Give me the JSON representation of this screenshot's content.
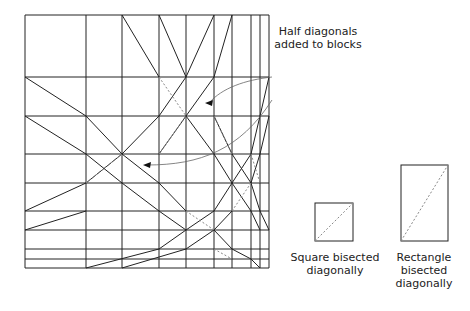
{
  "diagram": {
    "grid": {
      "x": [
        25,
        86,
        122,
        159,
        186,
        214,
        232,
        251,
        260,
        269
      ],
      "y": [
        15,
        77,
        116,
        154,
        183,
        211,
        230,
        249,
        259,
        268
      ],
      "stroke": "#222222"
    },
    "solid_diagonals": [
      [
        122,
        15,
        159,
        77
      ],
      [
        159,
        15,
        186,
        77
      ],
      [
        186,
        77,
        214,
        15
      ],
      [
        214,
        77,
        232,
        15
      ],
      [
        25,
        77,
        86,
        116
      ],
      [
        86,
        116,
        122,
        154
      ],
      [
        122,
        154,
        159,
        183
      ],
      [
        159,
        183,
        186,
        211
      ],
      [
        25,
        116,
        86,
        154
      ],
      [
        86,
        154,
        122,
        183
      ],
      [
        122,
        183,
        159,
        211
      ],
      [
        159,
        211,
        186,
        230
      ],
      [
        122,
        154,
        159,
        116
      ],
      [
        159,
        116,
        186,
        77
      ],
      [
        159,
        154,
        186,
        116
      ],
      [
        186,
        116,
        214,
        77
      ],
      [
        186,
        116,
        214,
        154
      ],
      [
        214,
        154,
        232,
        183
      ],
      [
        232,
        183,
        251,
        211
      ],
      [
        251,
        211,
        260,
        230
      ],
      [
        214,
        116,
        232,
        154
      ],
      [
        232,
        154,
        251,
        183
      ],
      [
        251,
        183,
        260,
        211
      ],
      [
        260,
        211,
        269,
        230
      ],
      [
        25,
        211,
        86,
        183
      ],
      [
        86,
        183,
        122,
        154
      ],
      [
        25,
        230,
        86,
        211
      ],
      [
        86,
        268,
        159,
        249
      ],
      [
        122,
        268,
        186,
        249
      ],
      [
        159,
        249,
        186,
        230
      ],
      [
        186,
        230,
        214,
        211
      ],
      [
        214,
        211,
        232,
        183
      ],
      [
        186,
        249,
        214,
        230
      ],
      [
        214,
        230,
        232,
        211
      ],
      [
        214,
        230,
        232,
        249
      ],
      [
        232,
        249,
        251,
        259
      ],
      [
        251,
        259,
        260,
        268
      ],
      [
        232,
        183,
        251,
        154
      ],
      [
        251,
        154,
        260,
        116
      ],
      [
        260,
        116,
        269,
        77
      ],
      [
        251,
        183,
        260,
        154
      ],
      [
        260,
        154,
        269,
        116
      ]
    ],
    "dashed_diagonals": [
      [
        159,
        77,
        186,
        116
      ],
      [
        214,
        116,
        232,
        154
      ],
      [
        86,
        183,
        122,
        154
      ],
      [
        159,
        154,
        186,
        116
      ],
      [
        186,
        211,
        214,
        230
      ],
      [
        214,
        249,
        232,
        259
      ],
      [
        251,
        154,
        260,
        183
      ],
      [
        232,
        211,
        251,
        183
      ]
    ],
    "arrows": [
      {
        "path": "M272,77 C245,80 222,88 209,103",
        "head": [
          209,
          103
        ]
      },
      {
        "path": "M272,100 C240,150 200,165 147,165",
        "head": [
          147,
          165
        ]
      }
    ],
    "callout": {
      "line1": "Half diagonals",
      "line2": "added to blocks"
    },
    "square_example": {
      "rect": [
        315,
        203,
        38,
        38
      ],
      "label_line1": "Square bisected",
      "label_line2": "diagonally"
    },
    "rectangle_example": {
      "rect": [
        401,
        165,
        47,
        76
      ],
      "label_line1": "Rectangle",
      "label_line2": "bisected",
      "label_line3": "diagonally"
    }
  }
}
